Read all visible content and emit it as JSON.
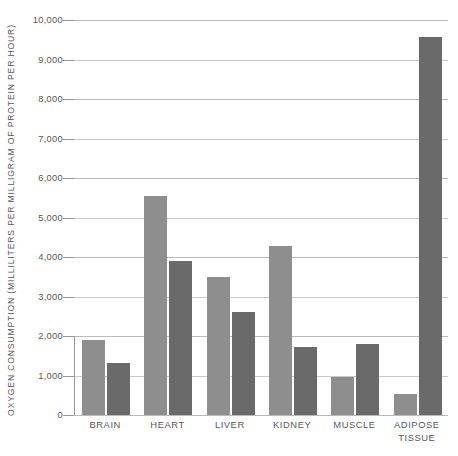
{
  "chart_data": {
    "type": "bar",
    "title": "",
    "subtitle": "",
    "xlabel": "",
    "ylabel": "OXYGEN CONSUMPTION (MILLILITERS PER MILLIGRAM OF PROTEIN PER HOUR)",
    "categories": [
      "BRAIN",
      "HEART",
      "LIVER",
      "KIDNEY",
      "MUSCLE",
      "ADIPOSE\nTISSUE"
    ],
    "ylim": [
      0,
      10000
    ],
    "ytick_labels": [
      "10,000",
      "9,000",
      "8,000",
      "7,000",
      "6,000",
      "5,000",
      "4,000",
      "3,000",
      "2,000",
      "1,000",
      "0"
    ],
    "ytick_values": [
      10000,
      9000,
      8000,
      7000,
      6000,
      5000,
      4000,
      3000,
      2000,
      1000,
      0
    ],
    "grid": true,
    "legend": "none",
    "series": [
      {
        "name": "light-series",
        "color": "#8e8e8e",
        "values": [
          1890,
          5550,
          3490,
          4280,
          960,
          540
        ]
      },
      {
        "name": "dark-series",
        "color": "#6a6a6a",
        "values": [
          1320,
          3900,
          2600,
          1720,
          1800,
          9580
        ]
      }
    ]
  },
  "colors": {
    "background": "#ffffff",
    "light_bar": "#8e8e8e",
    "dark_bar": "#6a6a6a",
    "gridline": "#b9b9ba",
    "text": "#59595a"
  }
}
